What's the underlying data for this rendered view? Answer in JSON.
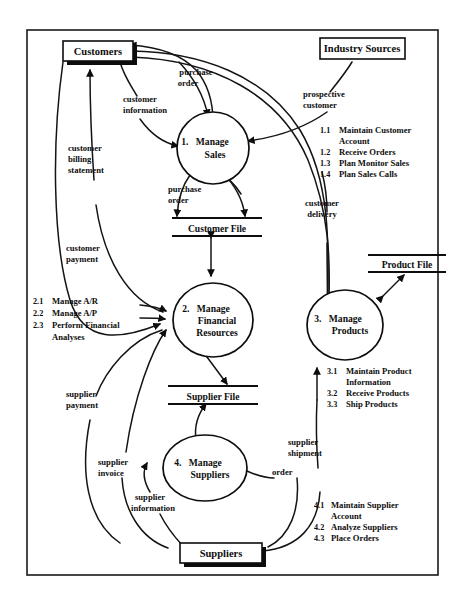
{
  "diagram": {
    "type": "data-flow-diagram",
    "background_color": "#ffffff",
    "line_color": "#0d0d0d"
  },
  "external_entities": [
    {
      "id": "customers",
      "label": "Customers"
    },
    {
      "id": "industry-sources",
      "label": "Industry Sources"
    },
    {
      "id": "suppliers",
      "label": "Suppliers"
    }
  ],
  "processes": [
    {
      "id": "p1",
      "number": "1.",
      "name_line1": "Manage",
      "name_line2": "Sales",
      "name_line3": ""
    },
    {
      "id": "p2",
      "number": "2.",
      "name_line1": "Manage",
      "name_line2": "Financial",
      "name_line3": "Resources"
    },
    {
      "id": "p3",
      "number": "3.",
      "name_line1": "Manage",
      "name_line2": "Products",
      "name_line3": ""
    },
    {
      "id": "p4",
      "number": "4.",
      "name_line1": "Manage",
      "name_line2": "Suppliers",
      "name_line3": ""
    }
  ],
  "data_stores": [
    {
      "id": "customer-file",
      "label": "Customer File"
    },
    {
      "id": "supplier-file",
      "label": "Supplier File"
    },
    {
      "id": "product-file",
      "label": "Product File"
    }
  ],
  "flow_labels": {
    "purchase_order_top_l1": "purchase",
    "purchase_order_top_l2": "order",
    "customer_information_l1": "customer",
    "customer_information_l2": "information",
    "prospective_customer_l1": "prospective",
    "prospective_customer_l2": "customer",
    "customer_billing_l1": "customer",
    "customer_billing_l2": "billing",
    "customer_billing_l3": "statement",
    "purchase_order_mid_l1": "purchase",
    "purchase_order_mid_l2": "order",
    "customer_delivery_l1": "customer",
    "customer_delivery_l2": "delivery",
    "customer_payment_l1": "customer",
    "customer_payment_l2": "payment",
    "supplier_payment_l1": "supplier",
    "supplier_payment_l2": "payment",
    "supplier_invoice_l1": "supplier",
    "supplier_invoice_l2": "invoice",
    "supplier_information_l1": "supplier",
    "supplier_information_l2": "information",
    "supplier_shipment_l1": "supplier",
    "supplier_shipment_l2": "shipment",
    "order": "order"
  },
  "sub_process_lists": [
    {
      "id": "list-1",
      "items": [
        {
          "num": "1.1",
          "text_l1": "Maintain Customer",
          "text_l2": "Account"
        },
        {
          "num": "1.2",
          "text_l1": "Receive Orders",
          "text_l2": ""
        },
        {
          "num": "1.3",
          "text_l1": "Plan Monitor Sales",
          "text_l2": ""
        },
        {
          "num": "1.4",
          "text_l1": "Plan Sales Calls",
          "text_l2": ""
        }
      ]
    },
    {
      "id": "list-2",
      "items": [
        {
          "num": "2.1",
          "text_l1": "Manage A/R",
          "text_l2": ""
        },
        {
          "num": "2.2",
          "text_l1": "Manage A/P",
          "text_l2": ""
        },
        {
          "num": "2.3",
          "text_l1": "Perform Financial",
          "text_l2": "Analyses"
        }
      ]
    },
    {
      "id": "list-3",
      "items": [
        {
          "num": "3.1",
          "text_l1": "Maintain Product",
          "text_l2": "Information"
        },
        {
          "num": "3.2",
          "text_l1": "Receive Products",
          "text_l2": ""
        },
        {
          "num": "3.3",
          "text_l1": "Ship Products",
          "text_l2": ""
        }
      ]
    },
    {
      "id": "list-4",
      "items": [
        {
          "num": "4.1",
          "text_l1": "Maintain Supplier",
          "text_l2": "Account"
        },
        {
          "num": "4.2",
          "text_l1": "Analyze Suppliers",
          "text_l2": ""
        },
        {
          "num": "4.3",
          "text_l1": "Place Orders",
          "text_l2": ""
        }
      ]
    }
  ]
}
